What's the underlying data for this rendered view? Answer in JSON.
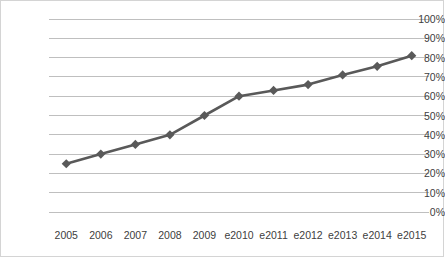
{
  "chart_data": {
    "type": "line",
    "title": "",
    "subtitle": "",
    "xlabel": "",
    "ylabel": "",
    "categories": [
      "2005",
      "2006",
      "2007",
      "2008",
      "2009",
      "e2010",
      "e2011",
      "e2012",
      "e2013",
      "e2014",
      "e2015"
    ],
    "values": [
      25,
      30,
      35,
      40,
      50,
      60,
      63,
      66,
      71,
      75.5,
      81
    ],
    "series": [
      {
        "name": "",
        "values": [
          25,
          30,
          35,
          40,
          50,
          60,
          63,
          66,
          71,
          75.5,
          81
        ]
      }
    ],
    "ylim": [
      0,
      100
    ],
    "ytick_labels": [
      "0%",
      "10%",
      "20%",
      "30%",
      "40%",
      "50%",
      "60%",
      "70%",
      "80%",
      "90%",
      "100%"
    ],
    "ytick_values": [
      0,
      10,
      20,
      30,
      40,
      50,
      60,
      70,
      80,
      90,
      100
    ],
    "grid": true,
    "grid_axis": "y",
    "legend": false,
    "legend_position": "none",
    "annotations": [],
    "marker": "diamond",
    "colors": {
      "line": "#595959",
      "marker": "#595959",
      "grid": "#bfbfbf",
      "background": "#ffffff",
      "border": "#d4d4d4",
      "tick_text": "#404040"
    }
  },
  "plot_geometry": {
    "left": 48,
    "right": 428,
    "top": 18,
    "bottom": 211,
    "x_label_y": 229
  }
}
